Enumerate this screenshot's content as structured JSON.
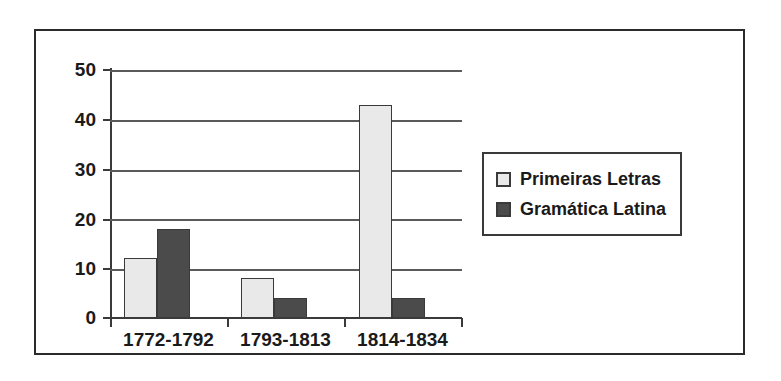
{
  "chart_data": {
    "type": "bar",
    "title": "",
    "subtitle": "",
    "xlabel": "",
    "ylabel": "",
    "categories": [
      "1772-1792",
      "1793-1813",
      "1814-1834"
    ],
    "series": [
      {
        "name": "Primeiras Letras",
        "values": [
          12,
          8,
          43
        ],
        "color": "#e9e9e9"
      },
      {
        "name": "Gramática Latina",
        "values": [
          18,
          4,
          4
        ],
        "color": "#4b4b4b"
      }
    ],
    "ylim": [
      0,
      50
    ],
    "yticks": [
      0,
      10,
      20,
      30,
      40,
      50
    ],
    "ytick_labels": [
      "0",
      "10",
      "20",
      "30",
      "40",
      "50"
    ],
    "grid": true,
    "grid_axis": "y",
    "legend_position": "right",
    "frame": true,
    "annotations": []
  },
  "colors": {
    "series_light": "#e9e9e9",
    "series_dark": "#4b4b4b",
    "axis": "#3a3a3a",
    "grid": "#5a5a5a",
    "text": "#1a1a1a",
    "background": "#ffffff"
  }
}
